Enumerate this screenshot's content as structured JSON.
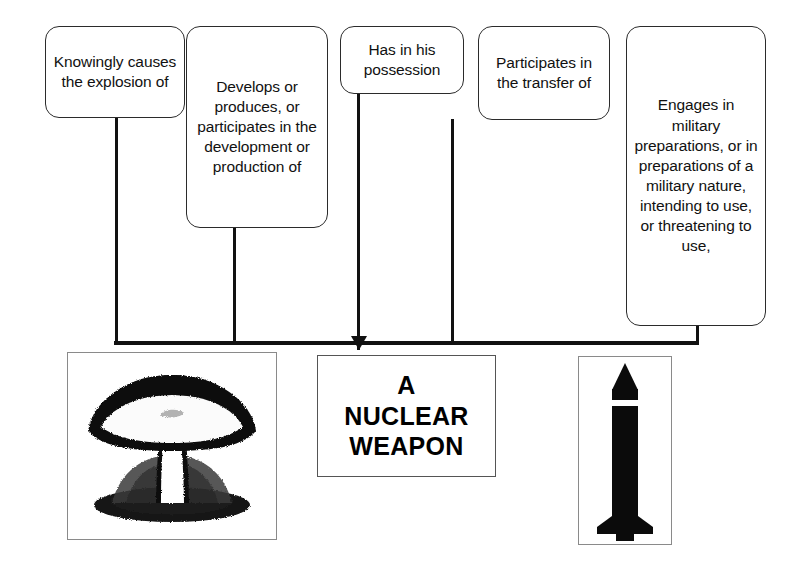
{
  "diagram": {
    "conditions": [
      {
        "id": "cond-knowingly-causes-explosion",
        "text": "Knowingly causes the explosion of"
      },
      {
        "id": "cond-develops-or-produces",
        "text": "Develops or produces, or participates in the development or production of"
      },
      {
        "id": "cond-has-in-possession",
        "text": "Has in his possession"
      },
      {
        "id": "cond-participates-in-transfer",
        "text": "Participates in the transfer of"
      },
      {
        "id": "cond-engages-in-military-preparations",
        "text": "Engages in military preparations, or in preparations of a military nature, intending to use, or threatening to use,"
      }
    ],
    "target": {
      "label": "A NUCLEAR WEAPON",
      "lines": [
        "A",
        "NUCLEAR",
        "WEAPON"
      ]
    },
    "images": [
      {
        "id": "mushroom-cloud-image",
        "caption": "mushroom-cloud-illustration"
      },
      {
        "id": "missile-image",
        "caption": "nuclear-missile-illustration"
      }
    ],
    "colors": {
      "line": "#111111",
      "box_border": "#2b2b2b",
      "frame_border": "#8a8a8a",
      "background": "#ffffff",
      "text": "#111111"
    }
  }
}
